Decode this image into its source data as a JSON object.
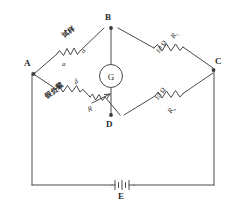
{
  "diagram": {
    "line_color": "#4a4a4a",
    "text_color": "#2b2b2b",
    "nodes": [
      {
        "id": "A",
        "label": "A"
      },
      {
        "id": "B",
        "label": "B"
      },
      {
        "id": "C",
        "label": "C"
      },
      {
        "id": "D",
        "label": "D"
      },
      {
        "id": "E",
        "label": "E"
      }
    ],
    "meter": {
      "symbol": "G",
      "name": "galvanometer"
    },
    "source": {
      "symbol": "E",
      "name": "battery"
    },
    "branches": {
      "ab": {
        "component_name": "试样",
        "terminal_left": "a",
        "terminal_right": "b"
      },
      "bc": {
        "symbol": "R",
        "subscript": "1",
        "value": "10 Ω"
      },
      "ad": {
        "component_name": "假负载",
        "terminal": "d",
        "rheostat_symbol": "R"
      },
      "dc": {
        "value": "10 Ω",
        "symbol": "R",
        "subscript": "n"
      }
    }
  }
}
